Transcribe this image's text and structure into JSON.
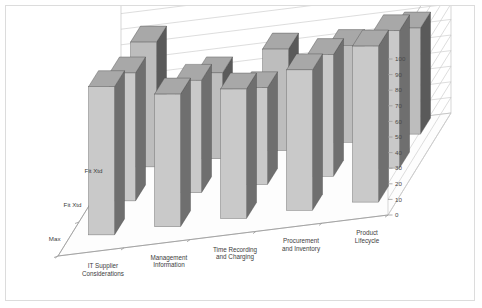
{
  "chart": {
    "type": "3d-bar",
    "frame_color": "#dcdcdc",
    "background": "#ffffff"
  },
  "chart_data": {
    "type": "bar",
    "title": "",
    "subtitle": "",
    "xlabel": "",
    "ylabel": "",
    "ylim": [
      0,
      100
    ],
    "ytick_step": 10,
    "yticks": [
      "0",
      "10",
      "20",
      "30",
      "40",
      "50",
      "60",
      "70",
      "80",
      "90",
      "100"
    ],
    "grid": true,
    "legend": "none",
    "axis_position": "right",
    "projection": "3d-depth-rows",
    "categories": [
      "IT Supplier Considerations",
      "Management Information",
      "Time Recording and Charging",
      "Procurement and Inventory",
      "Product Lifecycle"
    ],
    "depth_labels": [
      "Max",
      "Fit Xtd",
      "Fit Xtd"
    ],
    "series": [
      {
        "name": "Max",
        "row": 0,
        "values": [
          95,
          85,
          83,
          90,
          100
        ]
      },
      {
        "name": "Fit Xtd",
        "row": 1,
        "values": [
          82,
          72,
          62,
          78,
          88
        ]
      },
      {
        "name": "Fit Xtd",
        "row": 2,
        "values": [
          80,
          55,
          65,
          62,
          68
        ]
      }
    ],
    "bar_colors": {
      "front": "#c9c9c9",
      "side": "#6f6f6f",
      "top": "#a8a8a8",
      "front_back_row": "#bdbdbd",
      "side_back_row": "#5a5a5a"
    },
    "gridline_color": "#cfcfcf",
    "axis_color": "#9a9a9a"
  }
}
